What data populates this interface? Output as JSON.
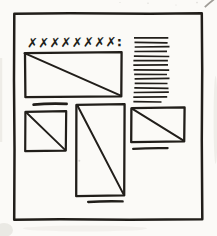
{
  "sketch": {
    "headline_placeholder": "✗✗✗✗✗✗✗✗:",
    "colors": {
      "ink": "#211e1a",
      "paper": "#fbfaf7",
      "smudge": "#b5b2ac"
    },
    "text_block": {
      "line_count": 15
    },
    "icons": {
      "image_placeholder": "rect-with-diagonal",
      "caption_rule": "horizontal-line",
      "headline": "row-of-x-marks"
    }
  }
}
